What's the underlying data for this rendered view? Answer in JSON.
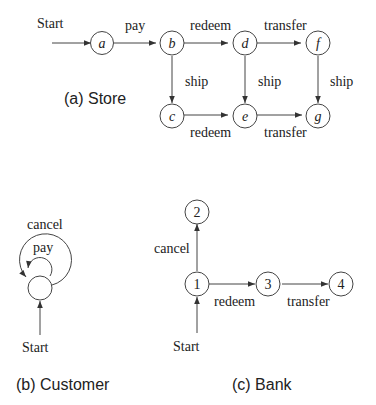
{
  "store": {
    "caption": "(a) Store",
    "start_label": "Start",
    "nodes": [
      "a",
      "b",
      "c",
      "d",
      "e",
      "f",
      "g"
    ],
    "edges": [
      {
        "from": "start",
        "to": "a",
        "label": ""
      },
      {
        "from": "a",
        "to": "b",
        "label": "pay"
      },
      {
        "from": "b",
        "to": "d",
        "label": "redeem"
      },
      {
        "from": "d",
        "to": "f",
        "label": "transfer"
      },
      {
        "from": "b",
        "to": "c",
        "label": "ship"
      },
      {
        "from": "d",
        "to": "e",
        "label": "ship"
      },
      {
        "from": "f",
        "to": "g",
        "label": "ship"
      },
      {
        "from": "c",
        "to": "e",
        "label": "redeem"
      },
      {
        "from": "e",
        "to": "g",
        "label": "transfer"
      }
    ]
  },
  "customer": {
    "caption": "(b) Customer",
    "start_label": "Start",
    "edges": [
      {
        "from": "s",
        "to": "s",
        "label": "cancel"
      },
      {
        "from": "s",
        "to": "s",
        "label": "pay"
      }
    ]
  },
  "bank": {
    "caption": "(c) Bank",
    "start_label": "Start",
    "nodes": [
      "1",
      "2",
      "3",
      "4"
    ],
    "edges": [
      {
        "from": "start",
        "to": "1",
        "label": ""
      },
      {
        "from": "1",
        "to": "2",
        "label": "cancel"
      },
      {
        "from": "1",
        "to": "3",
        "label": "redeem"
      },
      {
        "from": "3",
        "to": "4",
        "label": "transfer"
      }
    ]
  }
}
